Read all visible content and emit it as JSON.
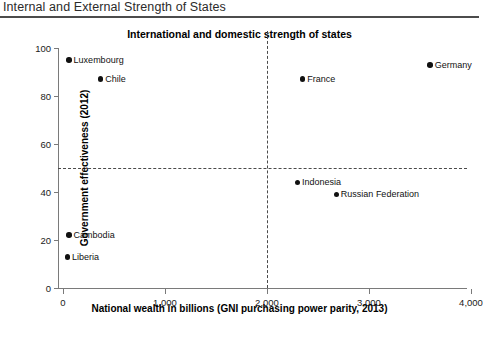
{
  "page": {
    "title": "Internal and External Strength of States",
    "source_note": ""
  },
  "chart_data": {
    "type": "scatter",
    "title": "International and domestic strength of states",
    "xlabel": "National wealth in billions (GNI purchasing power parity, 2013)",
    "ylabel": "Government effectiveness (2012)",
    "xlim": [
      0,
      4000
    ],
    "ylim": [
      0,
      100
    ],
    "xticks": [
      0,
      1000,
      2000,
      3000,
      4000
    ],
    "xtick_labels": [
      "0",
      "1,000",
      "2,000",
      "3,000",
      "4,000"
    ],
    "yticks": [
      0,
      20,
      40,
      60,
      80,
      100
    ],
    "ytick_labels": [
      "0",
      "20",
      "40",
      "60",
      "80",
      "100"
    ],
    "grid": false,
    "legend": "none",
    "reference_lines": [
      {
        "axis": "x",
        "value": 2000,
        "style": "dashed"
      },
      {
        "axis": "y",
        "value": 50,
        "style": "dashed"
      }
    ],
    "points": [
      {
        "label": "Luxembourg",
        "x": 60,
        "y": 95,
        "label_side": "right"
      },
      {
        "label": "Chile",
        "x": 370,
        "y": 87,
        "label_side": "right"
      },
      {
        "label": "France",
        "x": 2350,
        "y": 87,
        "label_side": "right"
      },
      {
        "label": "Germany",
        "x": 3600,
        "y": 93,
        "label_side": "right"
      },
      {
        "label": "Indonesia",
        "x": 2300,
        "y": 44,
        "label_side": "right"
      },
      {
        "label": "Russian Federation",
        "x": 2680,
        "y": 39,
        "label_side": "right"
      },
      {
        "label": "Cambodia",
        "x": 60,
        "y": 22,
        "label_side": "right"
      },
      {
        "label": "Liberia",
        "x": 45,
        "y": 13,
        "label_side": "right"
      }
    ]
  }
}
